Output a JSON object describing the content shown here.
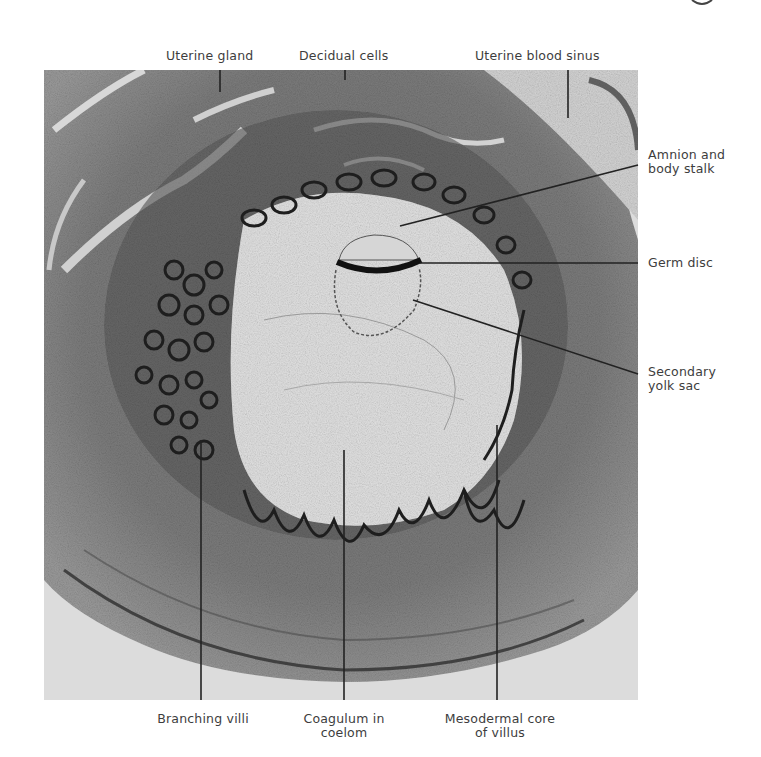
{
  "figure": {
    "labels_top": [
      {
        "id": "uterine-gland",
        "text": "Uterine gland"
      },
      {
        "id": "decidual-cells",
        "text": "Decidual cells"
      },
      {
        "id": "uterine-blood-sinus",
        "text": "Uterine blood sinus"
      }
    ],
    "labels_right": [
      {
        "id": "amnion-body-stalk",
        "line1": "Amnion and",
        "line2": "body stalk"
      },
      {
        "id": "germ-disc",
        "line1": "Germ disc"
      },
      {
        "id": "secondary-yolk-sac",
        "line1": "Secondary",
        "line2": "yolk sac"
      }
    ],
    "labels_bottom": [
      {
        "id": "branching-villi",
        "line1": "Branching villi"
      },
      {
        "id": "coagulum-coelom",
        "line1": "Coagulum in",
        "line2": "coelom"
      },
      {
        "id": "mesodermal-core",
        "line1": "Mesodermal core",
        "line2": "of villus"
      }
    ],
    "colors": {
      "tissue_dark": "#2a2a2a",
      "tissue_mid": "#8a8a8a",
      "tissue_light": "#cfcfcf",
      "coelom": "#e4e4e4",
      "background_outside": "#dadada",
      "leader_line": "#222222",
      "label_text": "#3d3d3d"
    }
  }
}
